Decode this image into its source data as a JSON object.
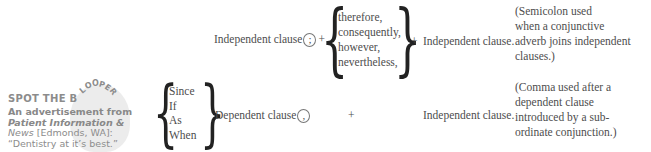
{
  "blooper": {
    "title_prefix": "SPOT THE B",
    "title_arc": [
      "L",
      "O",
      "O",
      "P",
      "E",
      "R"
    ],
    "caption_line1": "An advertisement from",
    "caption_source": "Patient Information &",
    "caption_source2": "News",
    "caption_location": " [Edmonds, WA]:",
    "caption_quote": "“Dentistry at it’s best.”"
  },
  "rule1": {
    "clause_left": "Independent clause",
    "punctuation": ";",
    "plus1": "+",
    "adverbs": [
      "therefore,",
      "consequently,",
      "however,",
      "nevertheless,"
    ],
    "plus2": "+",
    "clause_right": "Independent clause.",
    "note": [
      "(Semicolon used",
      "when a conjunctive",
      "adverb joins independent",
      "clauses.)"
    ]
  },
  "rule2": {
    "conjunctions": [
      "Since",
      "If",
      "As",
      "When"
    ],
    "clause_left": "Dependent clause",
    "punctuation": ",",
    "plus": "+",
    "clause_right": "Independent clause.",
    "note": [
      "(Comma used after a",
      "dependent clause",
      "introduced by a sub-",
      "ordinate conjunction.)"
    ]
  }
}
